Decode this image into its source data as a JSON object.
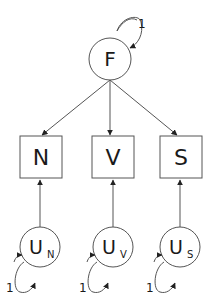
{
  "diagram": {
    "type": "structural-equation-model",
    "latent_factor": {
      "label": "F",
      "variance_label": "1"
    },
    "observed": [
      {
        "label": "N"
      },
      {
        "label": "V"
      },
      {
        "label": "S"
      }
    ],
    "uniques": [
      {
        "label": "U",
        "sub": "N",
        "variance_label": "1"
      },
      {
        "label": "U",
        "sub": "V",
        "variance_label": "1"
      },
      {
        "label": "U",
        "sub": "S",
        "variance_label": "1"
      }
    ],
    "colors": {
      "stroke": "#555555",
      "text": "#1a1a1a",
      "background": "#ffffff"
    }
  }
}
